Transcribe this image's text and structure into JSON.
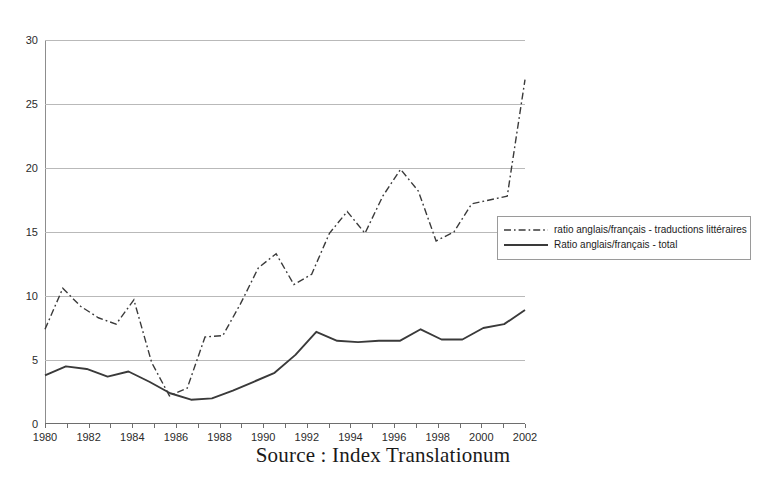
{
  "top_remnant": "",
  "caption": "Source : Index Translationum",
  "legend": {
    "items": [
      {
        "label": "ratio anglais/français - traductions littéraires",
        "style": "dash-dot",
        "color": "#3a3a3a"
      },
      {
        "label": "Ratio anglais/français - total",
        "style": "solid",
        "color": "#3a3a3a"
      }
    ]
  },
  "chart_data": {
    "type": "line",
    "title": "",
    "subtitle": "",
    "xlabel": "",
    "ylabel": "",
    "xlim": [
      1980,
      2002
    ],
    "ylim": [
      0,
      30
    ],
    "grid": true,
    "legend_position": "right",
    "x": [
      1980,
      1981,
      1982,
      1983,
      1984,
      1985,
      1986,
      1987,
      1988,
      1989,
      1990,
      1991,
      1992,
      1993,
      1994,
      1995,
      1996,
      1997,
      1998,
      1999,
      2000,
      2001,
      2002
    ],
    "xticks": [
      1980,
      1982,
      1984,
      1986,
      1988,
      1990,
      1992,
      1994,
      1996,
      1998,
      2000,
      2002
    ],
    "xtick_labels": [
      "1980",
      "1982",
      "1984",
      "1986",
      "1988",
      "1990",
      "1992",
      "1994",
      "1996",
      "1998",
      "2000",
      "2002"
    ],
    "yticks": [
      0,
      5,
      10,
      15,
      20,
      25,
      30
    ],
    "ytick_labels": [
      "0",
      "5",
      "10",
      "15",
      "20",
      "25",
      "30"
    ],
    "series": [
      {
        "name": "ratio anglais/français - traductions littéraires",
        "style": "dash-dot",
        "color": "#3a3a3a",
        "values": [
          7.4,
          10.6,
          9.2,
          8.3,
          7.8,
          9.7,
          4.8,
          2.2,
          2.8,
          6.8,
          6.9,
          9.4,
          12.2,
          13.3,
          10.9,
          11.7,
          16.6,
          15.0,
          16.0,
          19.9,
          18.2,
          14.3,
          15.0
        ]
      },
      {
        "name": "Ratio anglais/français - total",
        "style": "solid",
        "color": "#3a3a3a",
        "values": [
          3.8,
          4.5,
          4.3,
          3.7,
          4.1,
          3.3,
          2.4,
          1.9,
          2.0,
          2.6,
          3.3,
          4.0,
          5.4,
          7.2,
          6.5,
          6.4,
          6.5,
          6.5,
          6.5,
          7.0,
          7.4,
          6.6,
          6.6
        ]
      }
    ],
    "series_corrected": [
      {
        "name": "ratio anglais/français - traductions littéraires",
        "style": "dash-dot",
        "color": "#3a3a3a",
        "values": [
          7.4,
          10.6,
          9.2,
          8.3,
          7.8,
          9.7,
          4.8,
          2.2,
          2.8,
          6.8,
          6.9,
          9.4,
          12.2,
          13.3,
          10.9,
          11.7,
          14.9,
          16.6,
          14.9,
          17.8,
          19.9,
          18.2,
          14.3,
          15.0,
          17.2,
          17.5,
          17.8,
          26.9
        ]
      }
    ]
  }
}
